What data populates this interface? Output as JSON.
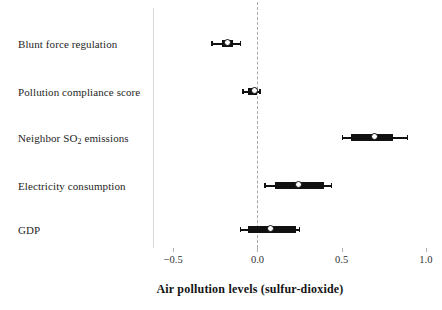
{
  "chart_data": {
    "type": "scatter",
    "subtype": "coefficient-forest-plot",
    "title": "",
    "xlabel": "Air pollution levels (sulfur-dioxide)",
    "ylabel": "",
    "xlim": [
      -0.62,
      1.06
    ],
    "xticks": [
      -0.5,
      0.0,
      0.5,
      1.0
    ],
    "xticklabels": [
      "−0.5",
      "0.0",
      "0.5",
      "1.0"
    ],
    "grid": false,
    "legend": null,
    "reference_line": {
      "x": 0.0,
      "style": "dashed",
      "color": "#a8a8a8"
    },
    "categories": [
      "Blunt force regulation",
      "Pollution compliance score",
      "Neighbor SO2 emissions",
      "Electricity consumption",
      "GDP"
    ],
    "point_color": "#111111",
    "point_fill": "#ffffff",
    "points": [
      {
        "label": "Blunt force regulation",
        "label_html": "Blunt force regulation",
        "estimate": -0.175,
        "inner_low": -0.21,
        "inner_high": -0.145,
        "outer_low": -0.275,
        "outer_high": -0.105
      },
      {
        "label": "Pollution compliance score",
        "label_html": "Pollution compliance score",
        "estimate": -0.02,
        "inner_low": -0.055,
        "inner_high": -0.002,
        "outer_low": -0.09,
        "outer_high": 0.012
      },
      {
        "label": "Neighbor SO2 emissions",
        "label_html": "Neighbor SO<sub>2</sub> emissions",
        "estimate": 0.695,
        "inner_low": 0.555,
        "inner_high": 0.805,
        "outer_low": 0.5,
        "outer_high": 0.885
      },
      {
        "label": "Electricity consumption",
        "label_html": "Electricity consumption",
        "estimate": 0.245,
        "inner_low": 0.105,
        "inner_high": 0.395,
        "outer_low": 0.04,
        "outer_high": 0.435
      },
      {
        "label": "GDP",
        "label_html": "GDP",
        "estimate": 0.075,
        "inner_low": -0.055,
        "inner_high": 0.23,
        "outer_low": -0.105,
        "outer_high": 0.245
      }
    ]
  },
  "axis": {
    "x_title": "Air pollution levels (sulfur-dioxide)",
    "tick_labels": [
      "−0.5",
      "0.0",
      "0.5",
      "1.0"
    ]
  }
}
